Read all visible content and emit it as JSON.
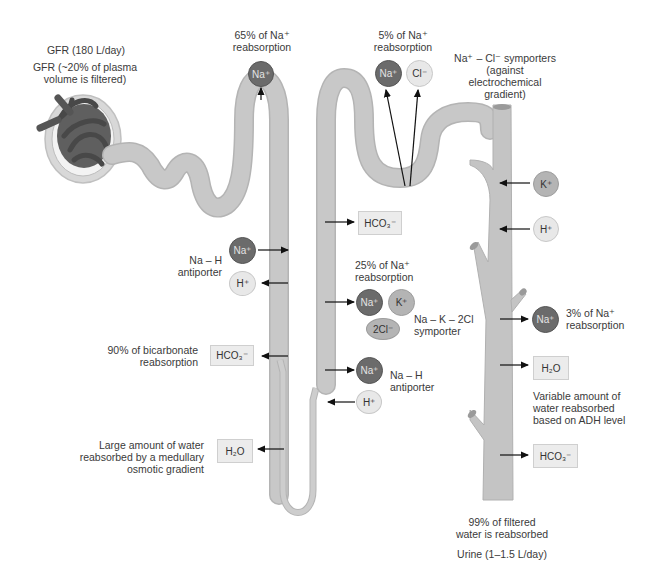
{
  "colors": {
    "tubule": "#c6c6c6",
    "tubule_edge": "#b4b4b4",
    "ion_dark": "#6b6b6b",
    "ion_mid": "#b4b4b4",
    "ion_light": "#e8e8e8",
    "box_bg": "#ececec",
    "text": "#3a3a3a"
  },
  "glomerulus": {
    "gfr_rate": "GFR (180 L/day)",
    "gfr_fraction_line1": "GFR (~20% of plasma",
    "gfr_fraction_line2": "volume is filtered)"
  },
  "proximal_tubule": {
    "na_reabsorption_line1": "65% of Na⁺",
    "na_reabsorption_line2": "reabsorption",
    "na_ion": "Na⁺",
    "antiporter_line1": "Na – H",
    "antiporter_line2": "antiporter",
    "antiporter_na": "Na⁺",
    "antiporter_h": "H⁺",
    "bicarbonate_line1": "90% of bicarbonate",
    "bicarbonate_line2": "reabsorption",
    "bicarbonate_box": "HCO₃⁻"
  },
  "descending_limb": {
    "water_line1": "Large amount of water",
    "water_line2": "reabsorbed by a medullary",
    "water_line3": "osmotic gradient",
    "water_box": "H₂O"
  },
  "ascending_limb": {
    "bicarbonate_box": "HCO₃⁻",
    "na_reabsorption_line1": "25% of Na⁺",
    "na_reabsorption_line2": "reabsorption",
    "symporter_na": "Na⁺",
    "symporter_k": "K⁺",
    "symporter_cl": "2Cl⁻",
    "symporter_line1": "Na – K – 2Cl",
    "symporter_line2": "symporter",
    "antiporter_na": "Na⁺",
    "antiporter_h": "H⁺",
    "antiporter_line1": "Na – H",
    "antiporter_line2": "antiporter"
  },
  "distal_tubule": {
    "na_reabsorption_line1": "5% of Na⁺",
    "na_reabsorption_line2": "reabsorption",
    "na_ion": "Na⁺",
    "cl_ion": "Cl⁻",
    "symporter_line1": "Na⁺ – Cl⁻ symporters",
    "symporter_line2": "(against",
    "symporter_line3": "electrochemical",
    "symporter_line4": "gradient)"
  },
  "collecting_duct": {
    "k_ion": "K⁺",
    "h_ion": "H⁺",
    "na_ion": "Na⁺",
    "na_reabsorption_line1": "3% of Na⁺",
    "na_reabsorption_line2": "reabsorption",
    "water_box": "H₂O",
    "adh_line1": "Variable amount of",
    "adh_line2": "water reabsorbed",
    "adh_line3": "based on ADH level",
    "bicarbonate_box": "HCO₃⁻",
    "filtered_line1": "99% of filtered",
    "filtered_line2": "water is reabsorbed",
    "urine_output": "Urine (1–1.5 L/day)"
  }
}
